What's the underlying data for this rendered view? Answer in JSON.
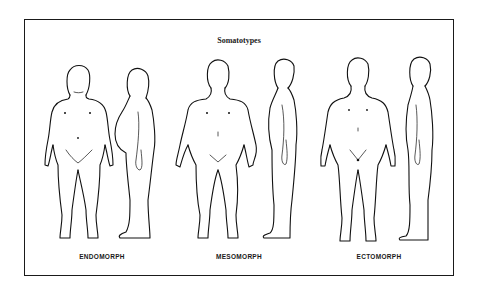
{
  "figure": {
    "title": "Somatotypes",
    "types": [
      {
        "label": "ENDOMORPH",
        "views": [
          "front",
          "side"
        ]
      },
      {
        "label": "MESOMORPH",
        "views": [
          "front",
          "side"
        ]
      },
      {
        "label": "ECTOMORPH",
        "views": [
          "front",
          "side"
        ]
      }
    ]
  },
  "colors": {
    "line": "#111111",
    "background": "#ffffff"
  }
}
